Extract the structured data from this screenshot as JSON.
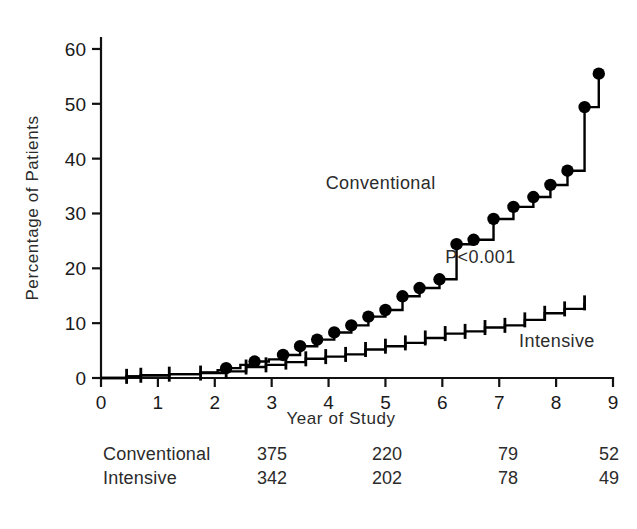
{
  "chart_data": {
    "type": "line",
    "subtype": "kaplan-meier-cumulative-incidence-step",
    "title": "",
    "xlabel": "Year of Study",
    "ylabel": "Percentage of Patients",
    "xlim": [
      0,
      9
    ],
    "ylim": [
      0,
      62
    ],
    "xticks": [
      "0",
      "1",
      "2",
      "3",
      "4",
      "5",
      "6",
      "7",
      "8",
      "9"
    ],
    "xtick_values": [
      0,
      1,
      2,
      3,
      4,
      5,
      6,
      7,
      8,
      9
    ],
    "yticks": [
      "0",
      "10",
      "20",
      "30",
      "40",
      "50",
      "60"
    ],
    "ytick_values": [
      0,
      10,
      20,
      30,
      40,
      50,
      60
    ],
    "grid": false,
    "legend": "inline-annotations",
    "annotations": [
      {
        "name": "p-value",
        "text": "P<0.001",
        "x": 6.05,
        "y": 21.0
      },
      {
        "name": "conventional-label",
        "text": "Conventional",
        "x": 3.95,
        "y": 34.5
      },
      {
        "name": "intensive-label",
        "text": "Intensive",
        "x": 7.35,
        "y": 5.6
      }
    ],
    "series": [
      {
        "name": "Conventional",
        "marker": "filled-circle",
        "color": "#000000",
        "x": [
          0.0,
          0.45,
          0.7,
          1.2,
          1.75,
          2.05,
          2.2,
          2.45,
          2.7,
          2.95,
          3.2,
          3.5,
          3.8,
          4.1,
          4.4,
          4.7,
          5.0,
          5.3,
          5.6,
          5.95,
          6.25,
          6.55,
          6.9,
          7.25,
          7.6,
          7.9,
          8.2,
          8.5,
          8.75
        ],
        "y": [
          0.0,
          0.3,
          0.5,
          0.7,
          1.0,
          1.4,
          1.8,
          2.4,
          3.0,
          3.4,
          4.2,
          5.8,
          7.0,
          8.3,
          9.6,
          11.2,
          12.4,
          14.9,
          16.4,
          18.0,
          24.4,
          25.2,
          29.0,
          31.2,
          33.0,
          35.2,
          37.8,
          49.4,
          55.5
        ],
        "event_marker_x": [
          2.2,
          2.7,
          3.2,
          3.5,
          3.8,
          4.1,
          4.4,
          4.7,
          5.0,
          5.3,
          5.6,
          5.95,
          6.25,
          6.55,
          6.9,
          7.25,
          7.6,
          7.9,
          8.2,
          8.5,
          8.75
        ],
        "event_marker_y": [
          1.8,
          3.0,
          4.2,
          5.8,
          7.0,
          8.3,
          9.6,
          11.2,
          12.4,
          14.9,
          16.4,
          18.0,
          24.4,
          25.2,
          29.0,
          31.2,
          33.0,
          35.2,
          37.8,
          49.4,
          55.5
        ],
        "final_value": 55.5
      },
      {
        "name": "Intensive",
        "marker": "censor-tick",
        "color": "#000000",
        "x": [
          0.0,
          0.45,
          0.7,
          1.2,
          1.75,
          2.2,
          2.55,
          2.9,
          3.25,
          3.6,
          3.95,
          4.3,
          4.65,
          5.0,
          5.35,
          5.7,
          6.05,
          6.4,
          6.75,
          7.1,
          7.45,
          7.8,
          8.15,
          8.5
        ],
        "y": [
          0.0,
          0.3,
          0.5,
          0.7,
          0.9,
          1.2,
          2.0,
          2.4,
          2.9,
          3.5,
          3.9,
          4.3,
          5.2,
          5.8,
          6.4,
          7.3,
          8.1,
          8.5,
          9.2,
          9.6,
          10.6,
          11.8,
          12.6,
          13.7
        ],
        "censor_marker_x": [
          0.45,
          0.7,
          1.2,
          1.75,
          2.2,
          2.55,
          2.9,
          3.25,
          3.6,
          3.95,
          4.3,
          4.65,
          5.0,
          5.35,
          5.7,
          6.05,
          6.4,
          6.75,
          7.1,
          7.45,
          7.8,
          8.15,
          8.5
        ],
        "censor_marker_y": [
          0.3,
          0.5,
          0.7,
          0.9,
          1.2,
          2.0,
          2.4,
          2.9,
          3.5,
          3.9,
          4.3,
          5.2,
          5.8,
          6.4,
          7.3,
          8.1,
          8.5,
          9.2,
          9.6,
          10.6,
          11.8,
          12.6,
          13.7
        ],
        "final_value": 13.7
      }
    ]
  },
  "risk_table": {
    "rows": [
      {
        "label": "Conventional",
        "values": [
          "375",
          "220",
          "79",
          "52"
        ]
      },
      {
        "label": "Intensive",
        "values": [
          "342",
          "202",
          "78",
          "49"
        ]
      }
    ],
    "column_years": [
      3,
      5,
      7,
      9
    ]
  }
}
